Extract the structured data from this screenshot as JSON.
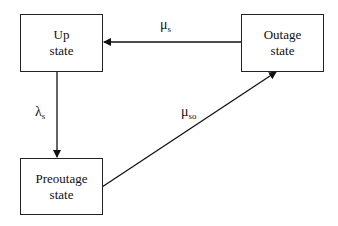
{
  "diagram": {
    "nodes": [
      {
        "id": "up",
        "line1": "Up",
        "line2": "state"
      },
      {
        "id": "outage",
        "line1": "Outage",
        "line2": "state"
      },
      {
        "id": "preoutage",
        "line1": "Preoutage",
        "line2": "state"
      }
    ],
    "edges": [
      {
        "from": "outage",
        "to": "up",
        "symbol": "μ",
        "subscript": "s"
      },
      {
        "from": "up",
        "to": "preoutage",
        "symbol": "λ",
        "subscript": "s"
      },
      {
        "from": "preoutage",
        "to": "outage",
        "symbol": "μ",
        "subscript": "so"
      }
    ]
  }
}
